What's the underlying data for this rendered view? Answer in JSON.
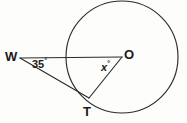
{
  "figure": {
    "kind": "circle-tangent-diagram",
    "background_color": "#fdfdfc",
    "stroke_color": "#2b2b2b",
    "text_color": "#1a1a1a",
    "labels": {
      "point_w": "W",
      "point_o": "O",
      "point_t": "T",
      "angle_at_w_value": "35",
      "angle_at_w_unit": "°",
      "angle_at_o_value": "x",
      "angle_at_o_unit": "°"
    },
    "geometry": {
      "circle": {
        "cx": 122,
        "cy": 57,
        "r": 56
      },
      "points": {
        "W": {
          "x": 20,
          "y": 58
        },
        "O": {
          "x": 122,
          "y": 57
        },
        "T": {
          "x": 88,
          "y": 97
        }
      },
      "segments": [
        {
          "name": "W-to-O",
          "from": "W",
          "to": "O"
        },
        {
          "name": "W-to-T",
          "from": "W",
          "to": "T"
        },
        {
          "name": "O-to-T",
          "from": "O",
          "to": "T"
        }
      ]
    }
  }
}
